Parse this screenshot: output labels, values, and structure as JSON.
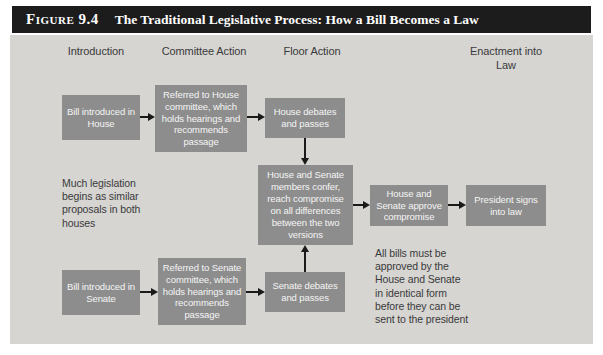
{
  "figure": {
    "label": "Figure 9.4",
    "title": "The Traditional Legislative Process: How a Bill Becomes a Law"
  },
  "columns": {
    "introduction": "Introduction",
    "committee_action": "Committee Action",
    "floor_action": "Floor Action",
    "enactment": "Enactment into Law"
  },
  "nodes": {
    "bill_house": "Bill introduced in House",
    "referred_house": "Referred to House committee, which holds hearings and recommends passage",
    "house_debates": "House debates and passes",
    "conference": "House and Senate members confer, reach compromise on all differences between the two versions",
    "approve_compromise": "House and Senate approve compromise",
    "president_signs": "President signs into law",
    "bill_senate": "Bill introduced in Senate",
    "referred_senate": "Referred to Senate committee, which holds hearings and recommends passage",
    "senate_debates": "Senate debates and passes"
  },
  "annotations": {
    "much_legislation": "Much legislation begins as similar proposals in both houses",
    "identical_form": "All bills must be approved by the House and Senate in identical form before they can be sent to the president"
  },
  "colors": {
    "title_bar_bg": "#1c1c1c",
    "title_text": "#ffffff",
    "panel_bg": "#d6d5d2",
    "node_bg": "#8d8d8d",
    "node_text": "#f5f5f5",
    "label_text": "#3a3a3a",
    "arrow": "#1a1a1a"
  }
}
